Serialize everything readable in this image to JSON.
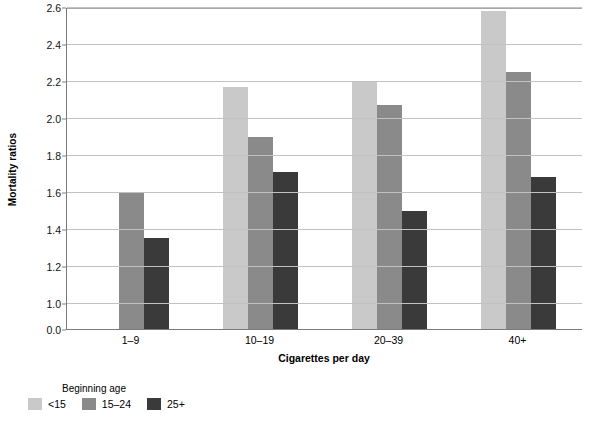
{
  "chart_data": {
    "type": "bar",
    "title": "",
    "xlabel": "Cigarettes per day",
    "ylabel": "Mortality ratios",
    "categories": [
      "1–9",
      "10–19",
      "20–39",
      "40+"
    ],
    "series": [
      {
        "name": "<15",
        "color": "#c9c9c9",
        "values": [
          null,
          2.17,
          2.2,
          2.58
        ]
      },
      {
        "name": "15–24",
        "color": "#8a8a8a",
        "values": [
          1.6,
          1.9,
          2.07,
          2.25
        ]
      },
      {
        "name": "25+",
        "color": "#3a3a3a",
        "values": [
          1.35,
          1.71,
          1.5,
          1.68
        ]
      }
    ],
    "ylim": [
      0.0,
      2.6
    ],
    "y_ticks": [
      "0.0",
      "1.0",
      "1.2",
      "1.4",
      "1.6",
      "1.8",
      "2.0",
      "2.2",
      "2.4",
      "2.6"
    ],
    "y_tick_values": [
      0.0,
      1.0,
      1.2,
      1.4,
      1.6,
      1.8,
      2.0,
      2.2,
      2.4,
      2.6
    ],
    "y_axis_broken": true,
    "grid": true,
    "legend": {
      "title": "Beginning age",
      "position": "below-left",
      "entries": [
        "<15",
        "15–24",
        "25+"
      ]
    },
    "gridline_color": "#c2c2c2",
    "axis_color": "#7a7a7a",
    "background": "#ffffff"
  }
}
